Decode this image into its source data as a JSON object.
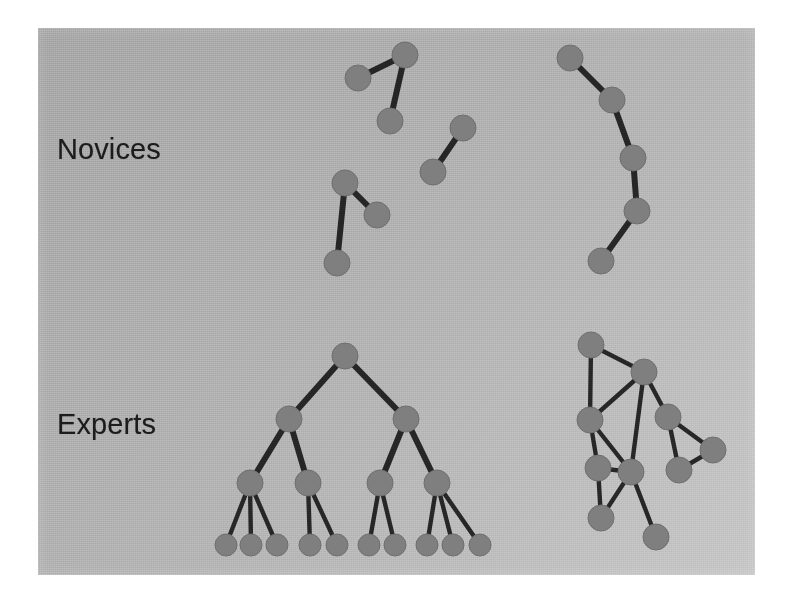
{
  "slide": {
    "title": "Novices versus Experts knowledge structures",
    "background_color": "#b0b0b0",
    "page_color": "#ffffff",
    "node_color": "#7f7f7f",
    "edge_color": "#1b1b1b",
    "text_color": "#1c1c1c"
  },
  "labels": {
    "novices": "Novices",
    "experts": "Experts"
  },
  "chart_data": {
    "type": "diagram",
    "xlabel": "",
    "ylabel": "",
    "grid": false,
    "legend": "none",
    "node_radius": 13,
    "leaf_radius": 11,
    "groups": [
      {
        "name": "novices-left",
        "row": "Novices",
        "label": "Novices",
        "description": "Sparse fragmented clusters: one 3-node chain, one isolated pair, one 3-node V",
        "node_count": 8,
        "edge_count": 5,
        "nodes": [
          {
            "id": "n1",
            "x": 358,
            "y": 78
          },
          {
            "id": "n2",
            "x": 405,
            "y": 55
          },
          {
            "id": "n3",
            "x": 390,
            "y": 121
          },
          {
            "id": "n4",
            "x": 463,
            "y": 128
          },
          {
            "id": "n5",
            "x": 433,
            "y": 172
          },
          {
            "id": "n6",
            "x": 345,
            "y": 183
          },
          {
            "id": "n7",
            "x": 377,
            "y": 215
          },
          {
            "id": "n8",
            "x": 337,
            "y": 263
          }
        ],
        "edges": [
          [
            "n1",
            "n2"
          ],
          [
            "n2",
            "n3"
          ],
          [
            "n4",
            "n5"
          ],
          [
            "n6",
            "n7"
          ],
          [
            "n6",
            "n8"
          ]
        ]
      },
      {
        "name": "novices-right",
        "row": "Novices",
        "label": "Novices",
        "description": "Single linear chain of five nodes",
        "node_count": 5,
        "edge_count": 4,
        "nodes": [
          {
            "id": "r1",
            "x": 570,
            "y": 58
          },
          {
            "id": "r2",
            "x": 612,
            "y": 100
          },
          {
            "id": "r3",
            "x": 633,
            "y": 158
          },
          {
            "id": "r4",
            "x": 637,
            "y": 211
          },
          {
            "id": "r5",
            "x": 601,
            "y": 261
          }
        ],
        "edges": [
          [
            "r1",
            "r2"
          ],
          [
            "r2",
            "r3"
          ],
          [
            "r3",
            "r4"
          ],
          [
            "r4",
            "r5"
          ]
        ]
      },
      {
        "name": "experts-tree",
        "row": "Experts",
        "label": "Experts",
        "description": "Balanced three-level hierarchy with ten leaf nodes",
        "node_count": 17,
        "edge_count": 16,
        "nodes": [
          {
            "id": "t0",
            "x": 345,
            "y": 356
          },
          {
            "id": "t1",
            "x": 289,
            "y": 419
          },
          {
            "id": "t2",
            "x": 406,
            "y": 419
          },
          {
            "id": "t3",
            "x": 250,
            "y": 483
          },
          {
            "id": "t4",
            "x": 308,
            "y": 483
          },
          {
            "id": "t5",
            "x": 380,
            "y": 483
          },
          {
            "id": "t6",
            "x": 437,
            "y": 483
          },
          {
            "id": "l1",
            "x": 226,
            "y": 545
          },
          {
            "id": "l2",
            "x": 251,
            "y": 545
          },
          {
            "id": "l3",
            "x": 277,
            "y": 545
          },
          {
            "id": "l4",
            "x": 310,
            "y": 545
          },
          {
            "id": "l5",
            "x": 337,
            "y": 545
          },
          {
            "id": "l6",
            "x": 369,
            "y": 545
          },
          {
            "id": "l7",
            "x": 395,
            "y": 545
          },
          {
            "id": "l8",
            "x": 427,
            "y": 545
          },
          {
            "id": "l9",
            "x": 453,
            "y": 545
          },
          {
            "id": "l10",
            "x": 480,
            "y": 545
          }
        ],
        "edges": [
          [
            "t0",
            "t1"
          ],
          [
            "t0",
            "t2"
          ],
          [
            "t1",
            "t3"
          ],
          [
            "t1",
            "t4"
          ],
          [
            "t2",
            "t5"
          ],
          [
            "t2",
            "t6"
          ],
          [
            "t3",
            "l1"
          ],
          [
            "t3",
            "l2"
          ],
          [
            "t3",
            "l3"
          ],
          [
            "t4",
            "l4"
          ],
          [
            "t4",
            "l5"
          ],
          [
            "t5",
            "l6"
          ],
          [
            "t5",
            "l7"
          ],
          [
            "t6",
            "l8"
          ],
          [
            "t6",
            "l9"
          ],
          [
            "t6",
            "l10"
          ]
        ]
      },
      {
        "name": "experts-network",
        "row": "Experts",
        "label": "Experts",
        "description": "Dense richly interconnected network with cycles and triangles",
        "node_count": 10,
        "edge_count": 16,
        "nodes": [
          {
            "id": "e1",
            "x": 591,
            "y": 345
          },
          {
            "id": "e2",
            "x": 644,
            "y": 372
          },
          {
            "id": "e3",
            "x": 590,
            "y": 420
          },
          {
            "id": "e4",
            "x": 668,
            "y": 417
          },
          {
            "id": "e5",
            "x": 598,
            "y": 468
          },
          {
            "id": "e6",
            "x": 631,
            "y": 472
          },
          {
            "id": "e7",
            "x": 713,
            "y": 450
          },
          {
            "id": "e8",
            "x": 679,
            "y": 470
          },
          {
            "id": "e9",
            "x": 601,
            "y": 518
          },
          {
            "id": "e10",
            "x": 656,
            "y": 537
          }
        ],
        "edges": [
          [
            "e1",
            "e2"
          ],
          [
            "e1",
            "e3"
          ],
          [
            "e2",
            "e3"
          ],
          [
            "e2",
            "e4"
          ],
          [
            "e2",
            "e6"
          ],
          [
            "e3",
            "e5"
          ],
          [
            "e3",
            "e6"
          ],
          [
            "e4",
            "e7"
          ],
          [
            "e4",
            "e8"
          ],
          [
            "e7",
            "e8"
          ],
          [
            "e5",
            "e6"
          ],
          [
            "e5",
            "e9"
          ],
          [
            "e6",
            "e9"
          ],
          [
            "e6",
            "e10"
          ]
        ]
      }
    ]
  }
}
